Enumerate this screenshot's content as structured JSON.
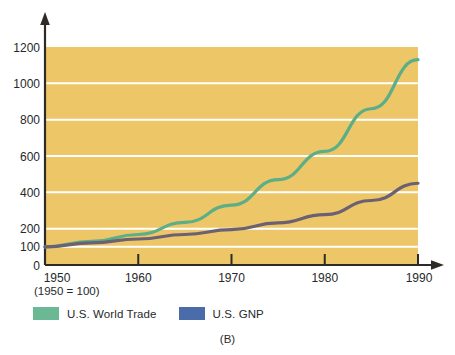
{
  "chart_data": {
    "type": "line",
    "title": "",
    "subtitle": "",
    "xlabel": "",
    "ylabel": "",
    "note": "(1950 = 100)",
    "panel_label": "(B)",
    "x": [
      1950,
      1960,
      1970,
      1980,
      1990
    ],
    "xlim": [
      1950,
      1990
    ],
    "ylim": [
      0,
      1200
    ],
    "xticks": [
      "1950",
      "1960",
      "1970",
      "1980",
      "1990"
    ],
    "yticks": [
      "0",
      "100",
      "200",
      "400",
      "600",
      "800",
      "1000",
      "1200"
    ],
    "ytick_values": [
      0,
      100,
      200,
      400,
      600,
      800,
      1000,
      1200
    ],
    "grid": true,
    "grid_color": "#FFFFFF",
    "plot_background": "#EDC767",
    "legend_position": "below-axis-left",
    "series": [
      {
        "name": "U.S. World Trade",
        "color": "#5CAE88",
        "legend_swatch_color": "#6BB894",
        "x": [
          1950,
          1955,
          1960,
          1965,
          1970,
          1975,
          1980,
          1985,
          1990
        ],
        "values": [
          100,
          130,
          168,
          235,
          330,
          470,
          625,
          860,
          1130
        ]
      },
      {
        "name": "U.S. GNP",
        "color": "#6B6173",
        "legend_swatch_color": "#4A6CA8",
        "x": [
          1950,
          1955,
          1960,
          1965,
          1970,
          1975,
          1980,
          1985,
          1990
        ],
        "values": [
          100,
          122,
          143,
          168,
          195,
          232,
          277,
          355,
          450
        ]
      }
    ]
  },
  "axes": {
    "y_axis_arrow": "arrow-up-icon",
    "x_axis_arrow": "arrow-right-icon"
  }
}
